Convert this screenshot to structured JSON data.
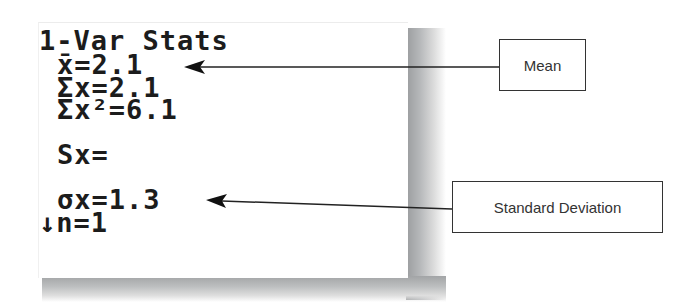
{
  "calculator_screen": {
    "lines": [
      "1-Var Stats",
      "x̄=2.1",
      "Σx=2.1",
      "Σx²=6.1",
      "Sx=",
      "σx=1.3",
      "↓n=1"
    ]
  },
  "annotations": {
    "mean": {
      "label": "Mean",
      "points_to_line": "x̄=2.1"
    },
    "standard_deviation": {
      "label": "Standard Deviation",
      "points_to_line": "σx=1.3"
    }
  },
  "colors": {
    "text": "#1c1c1c",
    "callout_border": "#333333",
    "shadow": "#a0a2a4",
    "background": "#ffffff"
  }
}
